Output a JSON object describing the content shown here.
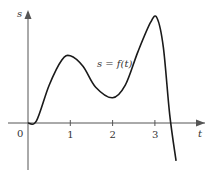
{
  "chart_data": {
    "type": "line",
    "title": "",
    "xlabel": "t",
    "ylabel": "s",
    "curve_label": "s = f(t)",
    "origin_label": "0",
    "x_ticks": [
      "1",
      "2",
      "3"
    ],
    "x_tick_values": [
      1,
      2,
      3
    ],
    "xlim": [
      0,
      3.7
    ],
    "ylim": [
      -0.9,
      2.6
    ],
    "series": [
      {
        "name": "s = f(t)",
        "x": [
          0,
          0.2,
          0.5,
          0.8,
          1.0,
          1.3,
          1.6,
          2.0,
          2.3,
          2.6,
          2.9,
          3.05,
          3.2,
          3.35,
          3.5
        ],
        "y": [
          0,
          0.05,
          0.9,
          1.5,
          1.6,
          1.35,
          0.85,
          0.6,
          0.9,
          1.7,
          2.4,
          2.5,
          1.8,
          0.2,
          -0.9
        ]
      }
    ],
    "colors": {
      "axis": "#555555",
      "curve": "#1a1a1a"
    }
  }
}
